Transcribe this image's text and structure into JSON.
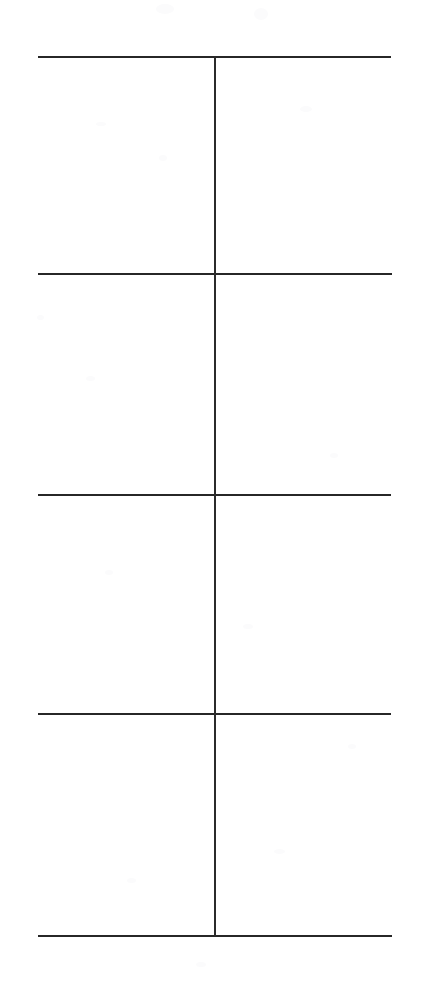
{
  "document": {
    "kind": "scanned-blank-table",
    "page_width": 435,
    "page_height": 988,
    "background_color": "#ffffff",
    "rule_color": "#272727",
    "text_content": "",
    "caption": ""
  },
  "grid": {
    "left": 38,
    "right": 391,
    "width": 353,
    "rule_thickness": 2,
    "horizontal_rules": [
      {
        "name": "rule-top",
        "y": 56,
        "x1": 38,
        "x2": 391
      },
      {
        "name": "rule-2",
        "y": 273,
        "x1": 38,
        "x2": 392
      },
      {
        "name": "rule-3",
        "y": 494,
        "x1": 38,
        "x2": 391
      },
      {
        "name": "rule-4",
        "y": 713,
        "x1": 38,
        "x2": 391
      },
      {
        "name": "rule-bottom",
        "y": 935,
        "x1": 38,
        "x2": 392
      }
    ],
    "vertical_rules": [
      {
        "name": "column-divider",
        "x": 214,
        "y1": 56,
        "y2": 936
      }
    ],
    "row_boundaries": [
      56,
      273,
      494,
      713,
      935
    ],
    "column_boundaries": [
      38,
      214,
      391
    ],
    "rows": 4,
    "columns": 2,
    "row_heights": [
      217,
      221,
      219,
      222
    ],
    "column_widths": [
      176,
      177
    ],
    "cells": [
      {
        "row": 1,
        "col": 1,
        "value": ""
      },
      {
        "row": 1,
        "col": 2,
        "value": ""
      },
      {
        "row": 2,
        "col": 1,
        "value": ""
      },
      {
        "row": 2,
        "col": 2,
        "value": ""
      },
      {
        "row": 3,
        "col": 1,
        "value": ""
      },
      {
        "row": 3,
        "col": 2,
        "value": ""
      },
      {
        "row": 4,
        "col": 1,
        "value": ""
      },
      {
        "row": 4,
        "col": 2,
        "value": ""
      }
    ]
  },
  "artifacts": {
    "scan_blobs": [
      {
        "x": 96,
        "y": 122,
        "w": 10,
        "h": 4
      },
      {
        "x": 156,
        "y": 4,
        "w": 18,
        "h": 10
      },
      {
        "x": 254,
        "y": 8,
        "w": 14,
        "h": 12
      },
      {
        "x": 159,
        "y": 155,
        "w": 8,
        "h": 6
      },
      {
        "x": 300,
        "y": 106,
        "w": 12,
        "h": 6
      },
      {
        "x": 86,
        "y": 376,
        "w": 9,
        "h": 5
      },
      {
        "x": 37,
        "y": 315,
        "w": 7,
        "h": 5
      },
      {
        "x": 105,
        "y": 570,
        "w": 8,
        "h": 5
      },
      {
        "x": 243,
        "y": 624,
        "w": 10,
        "h": 5
      },
      {
        "x": 127,
        "y": 878,
        "w": 9,
        "h": 5
      },
      {
        "x": 274,
        "y": 849,
        "w": 11,
        "h": 5
      },
      {
        "x": 330,
        "y": 453,
        "w": 8,
        "h": 5
      },
      {
        "x": 196,
        "y": 962,
        "w": 10,
        "h": 5
      },
      {
        "x": 348,
        "y": 744,
        "w": 8,
        "h": 5
      }
    ]
  }
}
